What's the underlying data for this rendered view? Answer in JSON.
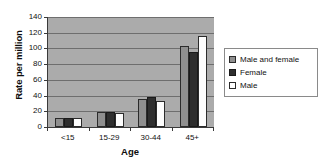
{
  "chart_data": {
    "type": "bar",
    "title": "",
    "xlabel": "Age",
    "ylabel": "Rate per million",
    "categories": [
      "<15",
      "15-29",
      "30-44",
      "45+"
    ],
    "series": [
      {
        "name": "Male and female",
        "color": "#8f8f8f",
        "values": [
          11,
          19,
          36,
          103
        ]
      },
      {
        "name": "Female",
        "color": "#2e2e2e",
        "values": [
          11,
          19,
          38,
          96
        ]
      },
      {
        "name": "Male",
        "color": "#ffffff",
        "values": [
          11,
          18,
          33,
          116
        ]
      }
    ],
    "ylim": [
      0,
      140
    ],
    "ytick_labels": [
      "0",
      "20",
      "40",
      "60",
      "80",
      "100",
      "120",
      "140"
    ],
    "ytick_values": [
      0,
      20,
      40,
      60,
      80,
      100,
      120,
      140
    ],
    "grid": true,
    "legend_position": "right",
    "plot_background": "#ababab",
    "gridline_color": "#6e6e6e",
    "axis_color": "#3a3a3a"
  },
  "legend": {
    "entries": [
      {
        "label": "Male and female",
        "swatch": "series-mf"
      },
      {
        "label": "Female",
        "swatch": "series-f"
      },
      {
        "label": "Male",
        "swatch": "series-m"
      }
    ]
  }
}
